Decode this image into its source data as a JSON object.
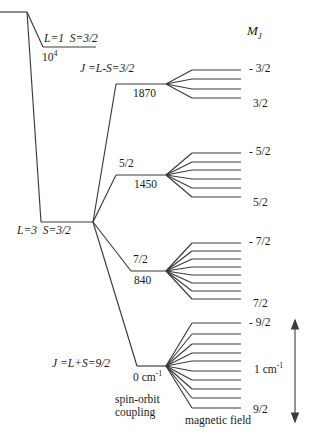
{
  "figure": {
    "type": "energy-level-diagram",
    "column_headers": {
      "mj": "M",
      "mj_sub": "J"
    },
    "axis_bottom_labels": {
      "spin_orbit_line1": "spin-orbit",
      "spin_orbit_line2": "coupling",
      "magnetic_field": "magnetic field"
    },
    "scale_bar": {
      "value": "1 cm",
      "exponent": "-1"
    },
    "configurations": [
      {
        "name": "excited-configuration",
        "label_L": "L=1",
        "label_S": "S=3/2",
        "energy": "10",
        "energy_exponent": "4"
      },
      {
        "name": "ground-configuration",
        "label_L": "L=3",
        "label_S": "S=3/2"
      }
    ],
    "j_levels": [
      {
        "name": "j-level-3-2",
        "j_label": "J =L-S=3/2",
        "j_short": "",
        "energy": "1870",
        "energy_unit": "",
        "sublevel_count": 4,
        "mj_top": "- 3/2",
        "mj_bottom": "3/2"
      },
      {
        "name": "j-level-5-2",
        "j_label": "",
        "j_short": "5/2",
        "energy": "1450",
        "energy_unit": "",
        "sublevel_count": 6,
        "mj_top": "- 5/2",
        "mj_bottom": "5/2"
      },
      {
        "name": "j-level-7-2",
        "j_label": "",
        "j_short": "7/2",
        "energy": "840",
        "energy_unit": "",
        "sublevel_count": 8,
        "mj_top": "- 7/2",
        "mj_bottom": "7/2"
      },
      {
        "name": "j-level-9-2",
        "j_label": "J =L+S=9/2",
        "j_short": "",
        "energy": "0 cm",
        "energy_unit": "-1",
        "sublevel_count": 10,
        "mj_top": "- 9/2",
        "mj_bottom": "9/2"
      }
    ],
    "colors": {
      "line": "#3a3a3a",
      "text": "#1a1a1a",
      "background": "#ffffff"
    }
  }
}
